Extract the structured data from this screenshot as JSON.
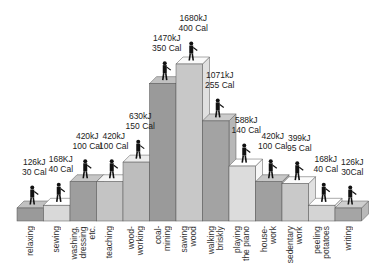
{
  "chart_data": {
    "type": "bar",
    "title": "",
    "xlabel": "",
    "ylabel": "",
    "style": "3d-stepped-bars-with-pictograms",
    "grid": false,
    "legend": null,
    "categories": [
      "relaxing",
      "sewing",
      "washing, dressing etc.",
      "teaching",
      "wood-working",
      "coal-mining",
      "sawing wood",
      "walking briskly",
      "playing the piano",
      "house-work",
      "sedentary work",
      "peeling potatoes",
      "writing"
    ],
    "category_label_lines": [
      [
        "relaxing"
      ],
      [
        "sewing"
      ],
      [
        "washing,",
        "dressing",
        "etc."
      ],
      [
        "teaching"
      ],
      [
        "wood-",
        "working"
      ],
      [
        "coal-",
        "mining"
      ],
      [
        "sawing",
        "wood"
      ],
      [
        "walking",
        "briskly"
      ],
      [
        "playing",
        "the piano"
      ],
      [
        "house-",
        "work"
      ],
      [
        "sedentary",
        "work"
      ],
      [
        "peeling",
        "potatoes"
      ],
      [
        "writing"
      ]
    ],
    "series": [
      {
        "name": "kJ",
        "values": [
          126,
          168,
          420,
          420,
          630,
          1470,
          1680,
          1071,
          588,
          420,
          399,
          168,
          126
        ]
      },
      {
        "name": "Cal",
        "values": [
          30,
          40,
          100,
          100,
          150,
          350,
          400,
          255,
          140,
          100,
          95,
          40,
          30
        ]
      }
    ],
    "value_labels": [
      [
        "126kJ",
        "30 Cal"
      ],
      [
        "168KJ",
        "40 Cal"
      ],
      [
        "420kJ",
        "100 Cal"
      ],
      [
        "420kJ",
        "100 Cal"
      ],
      [
        "630kJ",
        "150 Cal"
      ],
      [
        "1470kJ",
        "350 Cal"
      ],
      [
        "1680kJ",
        "400 Cal"
      ],
      [
        "1071kJ",
        "255 Cal"
      ],
      [
        "588kJ",
        "140 Cal"
      ],
      [
        "420kJ",
        "100 Cal"
      ],
      [
        "399kJ",
        "95 Cal"
      ],
      [
        "168kJ",
        "40 Cal"
      ],
      [
        "126kJ",
        "30Cal"
      ]
    ],
    "bar_colors": [
      "#9a9a9a",
      "#d9d9d9",
      "#9e9e9e",
      "#c4c4c4",
      "#bdbdbd",
      "#9a9a9a",
      "#c8c8c8",
      "#a3a3a3",
      "#dcdcdc",
      "#a0a0a0",
      "#c9c9c9",
      "#d4d4d4",
      "#a5a5a5"
    ]
  }
}
